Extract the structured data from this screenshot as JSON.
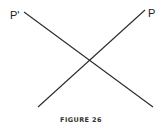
{
  "diagram": {
    "labels": {
      "left_top": "P'",
      "right_top": "P"
    },
    "caption": "FIGURE 26",
    "lines": [
      {
        "name": "line-p-prime",
        "x1": 24,
        "y1": 12,
        "x2": 153,
        "y2": 107
      },
      {
        "name": "line-p",
        "x1": 145,
        "y1": 10,
        "x2": 38,
        "y2": 107
      }
    ],
    "stroke_color": "#2a2a2a"
  }
}
